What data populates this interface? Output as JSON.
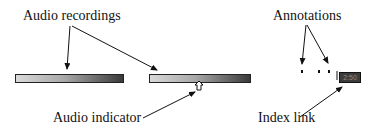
{
  "labels": {
    "audio_recordings": "Audio recordings",
    "annotations": "Annotations",
    "audio_indicator": "Audio indicator",
    "index_link": "Index link"
  },
  "index_link_box": {
    "text": "2:50"
  },
  "colors": {
    "bar_light": "#d9d9d9",
    "bar_dark": "#3a3a3a",
    "index_link_bg": "#3c3c3c"
  }
}
